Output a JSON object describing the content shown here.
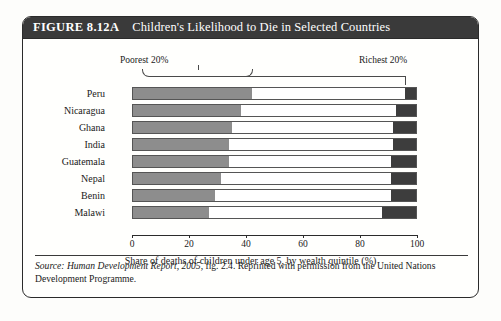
{
  "figure": {
    "number": "FIGURE 8.12A",
    "title": "Children's Likelihood to Die in Selected Countries"
  },
  "source_note": {
    "label": "Source:",
    "italic_part": "Human Development Report, 2005,",
    "rest": " fig. 2.4. Reprinted with permission from the United Nations Development Programme."
  },
  "annotations": {
    "poorest": "Poorest 20%",
    "richest": "Richest 20%"
  },
  "chart_data": {
    "type": "bar",
    "orientation": "horizontal",
    "stacked": true,
    "title": "Children's Likelihood to Die in Selected Countries",
    "xlabel": "Share of deaths of children under age 5, by wealth quintile (%)",
    "ylabel": "",
    "xlim": [
      0,
      100
    ],
    "xticks": [
      0,
      20,
      40,
      60,
      80,
      100
    ],
    "xticklabels": [
      "0",
      "20",
      "40",
      "60",
      "80",
      "100"
    ],
    "grid": false,
    "legend": "annotations",
    "categories": [
      "Peru",
      "Nicaragua",
      "Ghana",
      "India",
      "Guatemala",
      "Nepal",
      "Benin",
      "Malawi"
    ],
    "series": [
      {
        "name": "Poorest 20%",
        "color": "#8d8d8d",
        "values": [
          42,
          38,
          35,
          34,
          34,
          31,
          29,
          27
        ]
      },
      {
        "name": "Middle 60%",
        "color": "#ffffff",
        "values": [
          54,
          55,
          57,
          58,
          57,
          60,
          62,
          61
        ]
      },
      {
        "name": "Richest 20%",
        "color": "#3d3d3d",
        "values": [
          4,
          7,
          8,
          8,
          9,
          9,
          9,
          12
        ]
      }
    ]
  }
}
